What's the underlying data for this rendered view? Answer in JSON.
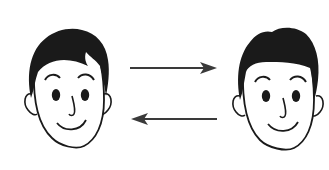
{
  "diagram": {
    "nodes": [
      {
        "id": "face-left",
        "label": "",
        "hair_style": "side-swept with fringe"
      },
      {
        "id": "face-right",
        "label": "",
        "hair_style": "short rounded"
      }
    ],
    "edges": [
      {
        "from": "face-left",
        "to": "face-right",
        "direction": "right",
        "label": ""
      },
      {
        "from": "face-right",
        "to": "face-left",
        "direction": "left",
        "label": ""
      }
    ],
    "colors": {
      "stroke": "#1a1a1a",
      "hair": "#1a1a1a",
      "arrow": "#3a3a3a",
      "background": "#ffffff"
    }
  }
}
